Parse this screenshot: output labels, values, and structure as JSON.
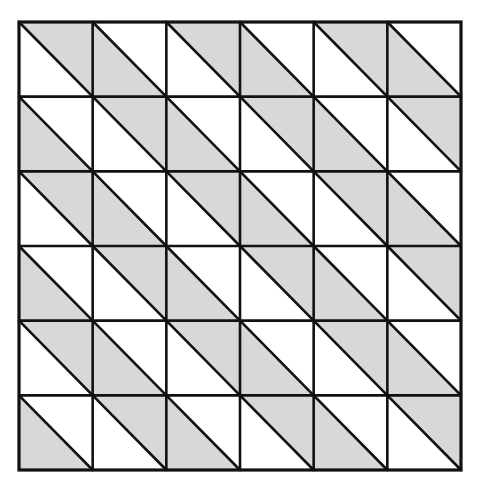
{
  "diagram": {
    "type": "triangle-tiling-grid",
    "rows": 6,
    "cols": 6,
    "bounds": {
      "x0": 19,
      "y0": 22,
      "x1": 461,
      "y1": 470
    },
    "diagonal_direction": "top-left-to-bottom-right",
    "colors": {
      "background": "#ffffff",
      "shade": "#d8d8d8",
      "line": "#111111"
    },
    "line_width": 2.6,
    "shading": [
      [
        "upper",
        "lower",
        "upper",
        "lower",
        "upper",
        "lower"
      ],
      [
        "lower",
        "upper",
        "lower",
        "upper",
        "lower",
        "upper"
      ],
      [
        "upper",
        "lower",
        "upper",
        "lower",
        "upper",
        "lower"
      ],
      [
        "lower",
        "upper",
        "lower",
        "upper",
        "lower",
        "upper"
      ],
      [
        "upper",
        "lower",
        "upper",
        "lower",
        "upper",
        "lower"
      ],
      [
        "lower",
        "upper",
        "lower",
        "upper",
        "lower",
        "upper"
      ]
    ]
  }
}
